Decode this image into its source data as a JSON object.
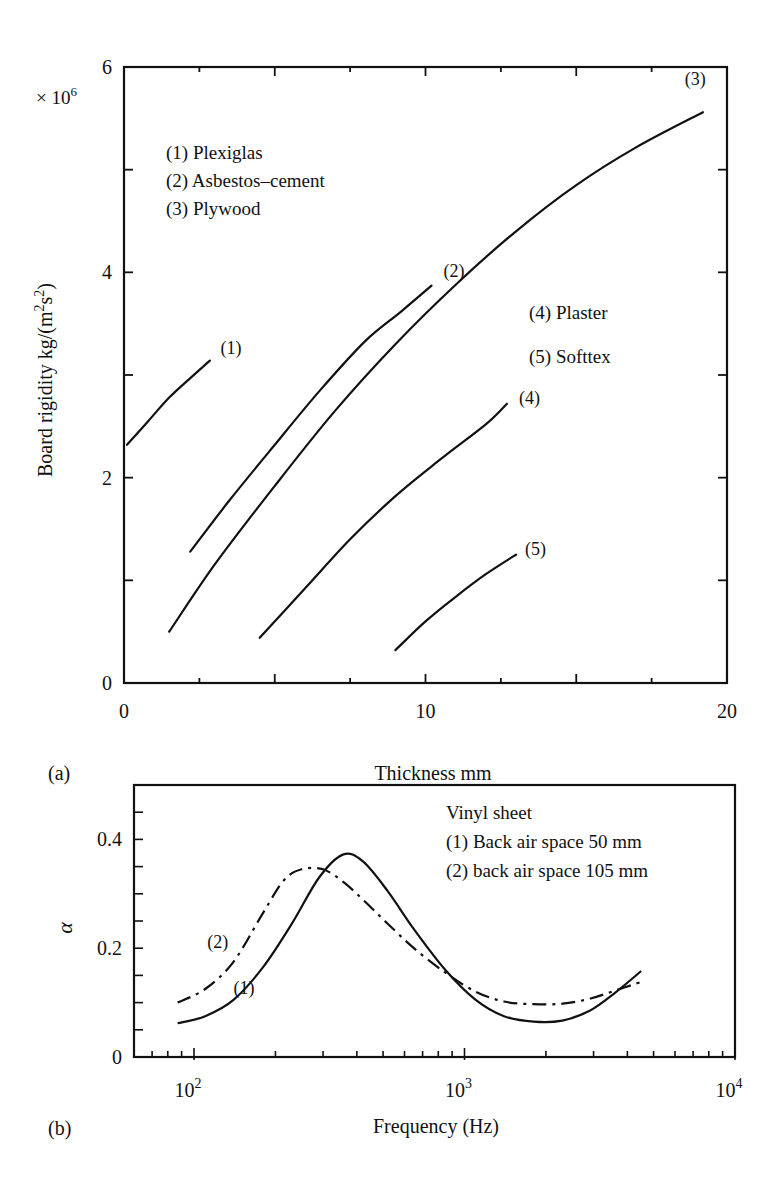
{
  "chart_data": [
    {
      "panel": "(a)",
      "type": "line",
      "title": "",
      "xlabel": "Thickness mm",
      "ylabel": "Board rigidity kg/(m²s²)",
      "ylabel_parts": {
        "pre": "Board rigidity kg/(m",
        "sup1": "2",
        "mid": "s",
        "sup2": "2",
        "post": ")"
      },
      "y_multiplier": "× 10",
      "y_multiplier_exp": "6",
      "xlim": [
        0,
        20
      ],
      "ylim": [
        0,
        6
      ],
      "x_ticks_major": [
        0,
        10,
        20
      ],
      "x_tick_labels": [
        "0",
        "10",
        "20"
      ],
      "x_ticks_all": [
        0,
        2.5,
        5,
        7.5,
        10,
        12.5,
        15,
        17.5,
        20
      ],
      "y_ticks_major": [
        0,
        2,
        4,
        6
      ],
      "y_tick_labels": [
        "0",
        "2",
        "4",
        "6"
      ],
      "y_ticks_all": [
        0,
        1,
        2,
        3,
        4,
        5,
        6
      ],
      "grid": false,
      "legend_left": [
        "(1) Plexiglas",
        "(2) Asbestos–cement",
        "(3) Plywood"
      ],
      "legend_right": [
        "(4) Plaster",
        "(5) Softtex"
      ],
      "series": [
        {
          "name": "(1) Plexiglas",
          "label": "(1)",
          "label_at": [
            3.2,
            3.2
          ],
          "x": [
            0.1,
            0.8,
            1.5,
            2.2,
            2.85
          ],
          "y": [
            2.32,
            2.55,
            2.78,
            2.97,
            3.14
          ]
        },
        {
          "name": "(2) Asbestos–cement",
          "label": "(2)",
          "label_at": [
            10.6,
            3.95
          ],
          "x": [
            2.2,
            3.5,
            5.0,
            6.5,
            8.0,
            9.2,
            10.2
          ],
          "y": [
            1.28,
            1.78,
            2.32,
            2.85,
            3.33,
            3.62,
            3.87
          ]
        },
        {
          "name": "(3) Plywood",
          "label": "(3)",
          "label_at": [
            18.6,
            5.82
          ],
          "x": [
            1.5,
            3.0,
            5.0,
            7.0,
            9.0,
            11.0,
            13.0,
            15.0,
            17.0,
            19.2
          ],
          "y": [
            0.5,
            1.15,
            1.92,
            2.65,
            3.3,
            3.88,
            4.4,
            4.85,
            5.22,
            5.56
          ]
        },
        {
          "name": "(4) Plaster",
          "label": "(4)",
          "label_at": [
            13.1,
            2.72
          ],
          "x": [
            4.5,
            6.0,
            7.5,
            9.0,
            10.5,
            12.0,
            12.7
          ],
          "y": [
            0.44,
            0.92,
            1.4,
            1.82,
            2.18,
            2.52,
            2.72
          ]
        },
        {
          "name": "(5) Softtex",
          "label": "(5)",
          "label_at": [
            13.3,
            1.25
          ],
          "x": [
            9.0,
            10.0,
            11.0,
            12.0,
            13.0
          ],
          "y": [
            0.32,
            0.6,
            0.84,
            1.06,
            1.25
          ]
        }
      ]
    },
    {
      "panel": "(b)",
      "type": "line",
      "title": "",
      "xlabel": "Frequency (Hz)",
      "ylabel": "α",
      "xscale": "log",
      "xlim": [
        60,
        10000
      ],
      "ylim": [
        0,
        0.5
      ],
      "x_ticks_major": [
        100,
        1000,
        10000
      ],
      "x_tick_labels": [
        {
          "base": "10",
          "exp": "2"
        },
        {
          "base": "10",
          "exp": "3"
        },
        {
          "base": "10",
          "exp": "4"
        }
      ],
      "y_ticks_major": [
        0,
        0.2,
        0.4
      ],
      "y_tick_labels": [
        "0",
        "0.2",
        "0.4"
      ],
      "y_ticks_all": [
        0,
        0.05,
        0.1,
        0.15,
        0.2,
        0.25,
        0.3,
        0.35,
        0.4,
        0.45
      ],
      "grid": false,
      "legend": [
        "Vinyl sheet",
        "(1) Back air space 50 mm",
        "(2) back air space 105 mm"
      ],
      "series": [
        {
          "name": "(1) Back air space 50 mm",
          "label": "(1)",
          "style": "solid",
          "label_at": [
            140,
            0.115
          ],
          "x": [
            87,
            110,
            140,
            180,
            230,
            290,
            355,
            420,
            520,
            650,
            850,
            1100,
            1400,
            1800,
            2300,
            2900,
            3600,
            4500
          ],
          "y": [
            0.062,
            0.075,
            0.105,
            0.165,
            0.245,
            0.33,
            0.372,
            0.36,
            0.305,
            0.235,
            0.16,
            0.105,
            0.075,
            0.065,
            0.067,
            0.085,
            0.118,
            0.158
          ]
        },
        {
          "name": "(2) back air space 105 mm",
          "label": "(2)",
          "style": "dashdot",
          "label_at": [
            112,
            0.2
          ],
          "x": [
            87,
            110,
            140,
            180,
            215,
            250,
            300,
            360,
            430,
            520,
            650,
            850,
            1100,
            1400,
            1800,
            2300,
            2900,
            3600,
            4500
          ],
          "y": [
            0.1,
            0.125,
            0.175,
            0.265,
            0.325,
            0.345,
            0.345,
            0.32,
            0.285,
            0.245,
            0.2,
            0.155,
            0.12,
            0.102,
            0.097,
            0.098,
            0.107,
            0.122,
            0.138
          ]
        }
      ]
    }
  ],
  "panels": {
    "a": {
      "tag": "(a)"
    },
    "b": {
      "tag": "(b)"
    }
  },
  "colors": {
    "ink": "#111111",
    "background": "#ffffff"
  }
}
